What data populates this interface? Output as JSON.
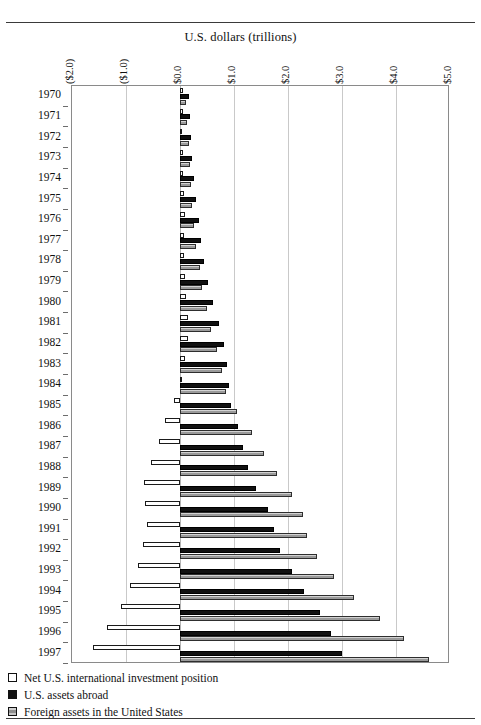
{
  "chart_data": {
    "type": "bar",
    "orientation": "horizontal",
    "title": "U.S. dollars (trillions)",
    "xlabel": "U.S. dollars (trillions)",
    "ylabel": "",
    "xlim": [
      -2.0,
      5.0
    ],
    "xticks": [
      -2.0,
      -1.0,
      0.0,
      1.0,
      2.0,
      3.0,
      4.0,
      5.0
    ],
    "xticklabels": [
      "($2.0)",
      "($1.0)",
      "$0.0",
      "$1.0",
      "$2.0",
      "$3.0",
      "$4.0",
      "$5.0"
    ],
    "grid": true,
    "legend_position": "below",
    "categories": [
      "1970",
      "1971",
      "1972",
      "1973",
      "1974",
      "1975",
      "1976",
      "1977",
      "1978",
      "1979",
      "1980",
      "1981",
      "1982",
      "1983",
      "1984",
      "1985",
      "1986",
      "1987",
      "1988",
      "1989",
      "1990",
      "1991",
      "1992",
      "1993",
      "1994",
      "1995",
      "1996",
      "1997"
    ],
    "series": [
      {
        "name": "Net U.S. international investment position",
        "swatch": "net",
        "color": "#ffffff",
        "values": [
          0.06,
          0.05,
          0.04,
          0.05,
          0.06,
          0.08,
          0.09,
          0.08,
          0.08,
          0.1,
          0.11,
          0.14,
          0.14,
          0.09,
          0.04,
          -0.11,
          -0.27,
          -0.38,
          -0.53,
          -0.67,
          -0.65,
          -0.61,
          -0.69,
          -0.78,
          -0.92,
          -1.1,
          -1.35,
          -1.61
        ]
      },
      {
        "name": "U.S. assets abroad",
        "swatch": "usa",
        "color": "#111111",
        "values": [
          0.17,
          0.18,
          0.2,
          0.23,
          0.26,
          0.3,
          0.35,
          0.38,
          0.45,
          0.51,
          0.61,
          0.72,
          0.82,
          0.87,
          0.9,
          0.95,
          1.07,
          1.17,
          1.26,
          1.41,
          1.63,
          1.74,
          1.85,
          2.07,
          2.3,
          2.6,
          2.8,
          3.0
        ]
      },
      {
        "name": "Foreign assets in the United States",
        "swatch": "frn",
        "color": "#a8a8a8",
        "values": [
          0.11,
          0.13,
          0.16,
          0.18,
          0.2,
          0.22,
          0.26,
          0.3,
          0.37,
          0.41,
          0.5,
          0.58,
          0.68,
          0.78,
          0.86,
          1.06,
          1.34,
          1.55,
          1.79,
          2.08,
          2.28,
          2.35,
          2.54,
          2.85,
          3.22,
          3.7,
          4.15,
          4.61
        ]
      }
    ]
  },
  "legend": {
    "items": [
      {
        "label": "Net U.S. international investment position",
        "swatch": "net"
      },
      {
        "label": "U.S. assets abroad",
        "swatch": "usa"
      },
      {
        "label": "Foreign assets in the United States",
        "swatch": "frn"
      }
    ]
  }
}
